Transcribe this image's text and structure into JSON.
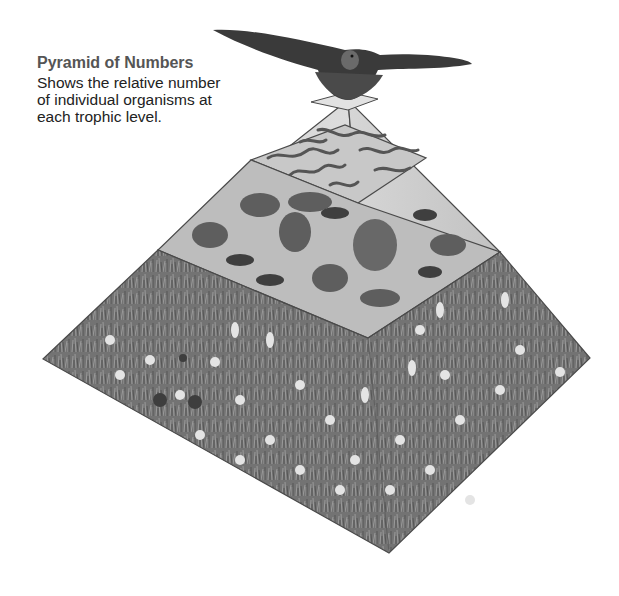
{
  "caption": {
    "title": "Pyramid of Numbers",
    "lines": [
      "Shows the relative number",
      "of individual organisms at",
      "each trophic level."
    ]
  },
  "pyramid": {
    "levels": [
      {
        "name": "Tertiary consumer",
        "organism": "hawk",
        "relative_count": "1"
      },
      {
        "name": "Secondary consumers",
        "organism": "snakes",
        "relative_count": "few"
      },
      {
        "name": "Primary consumers",
        "organism": "rodents, rabbit, grasshoppers",
        "relative_count": "more"
      },
      {
        "name": "Producers",
        "organism": "grasses and wildflowers",
        "relative_count": "most"
      }
    ],
    "colors": {
      "outline": "#4a4a4a",
      "face_light": "#d8d8d8",
      "face_mid": "#c4c4c4",
      "grass": "#7a7a7a",
      "grass_dark": "#5a5a5a",
      "flower": "#e6e6e6",
      "bird": "#3a3a3a"
    }
  }
}
